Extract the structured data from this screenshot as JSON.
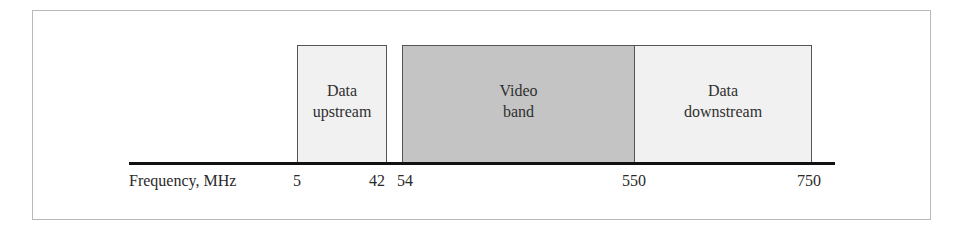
{
  "diagram": {
    "axis_label": "Frequency, MHz",
    "ticks": [
      {
        "value": "5",
        "x": 293
      },
      {
        "value": "42",
        "x": 369
      },
      {
        "value": "54",
        "x": 397
      },
      {
        "value": "550",
        "x": 622
      },
      {
        "value": "750",
        "x": 797
      }
    ],
    "bands": [
      {
        "line1": "Data",
        "line2": "upstream",
        "from_mhz": 5,
        "to_mhz": 42,
        "fill": "#f1f1f1"
      },
      {
        "line1": "Video",
        "line2": "band",
        "from_mhz": 54,
        "to_mhz": 550,
        "fill": "#c4c4c4"
      },
      {
        "line1": "Data",
        "line2": "downstream",
        "from_mhz": 550,
        "to_mhz": 750,
        "fill": "#f1f1f1"
      }
    ]
  }
}
